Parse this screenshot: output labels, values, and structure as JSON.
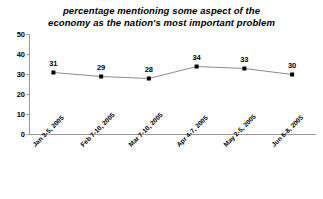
{
  "chart_data": {
    "type": "line",
    "title": "percentage mentioning some aspect of the economy as the nation's most important problem",
    "title_lines": [
      "percentage mentioning some aspect of the",
      "economy as the nation's most important problem"
    ],
    "categories": [
      "Jan 3-5, 2005",
      "Feb 7-10, 2005",
      "Mar 7-10, 2005",
      "Apr 4-7, 2005",
      "May 2-5, 2005",
      "Jun 6-8, 2005"
    ],
    "values": [
      31,
      29,
      28,
      34,
      33,
      30
    ],
    "xlabel": "",
    "ylabel": "",
    "ylim": [
      0,
      50
    ],
    "yticks": [
      0,
      10,
      20,
      30,
      40,
      50
    ],
    "ytick_labels": [
      "0",
      "10",
      "20",
      "30",
      "40",
      "50"
    ],
    "grid": false,
    "legend": false,
    "series": [
      {
        "name": "percentage mentioning economy",
        "values": [
          31,
          29,
          28,
          34,
          33,
          30
        ],
        "marker": "square",
        "marker_color": "#000000",
        "line_color": "#808080"
      }
    ],
    "data_labels": [
      "31",
      "29",
      "28",
      "34",
      "33",
      "30"
    ],
    "colors": {
      "background": "#ffffff",
      "axis": "#9a9a9a",
      "text": "#000000",
      "marker": "#000000",
      "line": "#8c8c8c"
    }
  }
}
